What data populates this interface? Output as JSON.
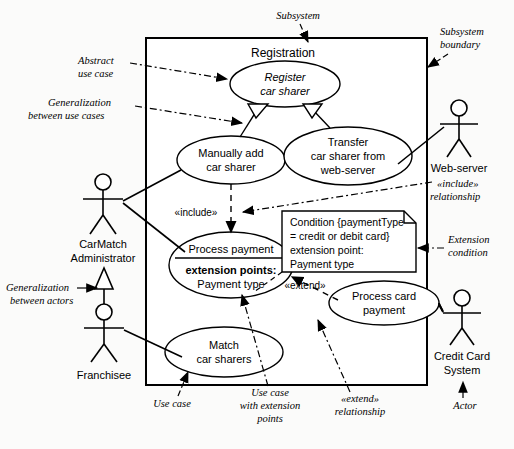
{
  "diagram": {
    "subsystem_label": "Registration",
    "stroke_color": "#000000",
    "background_color": "#fbfbfa"
  },
  "use_cases": [
    {
      "id": "register",
      "lines": [
        "Register",
        "car sharer"
      ],
      "style": "italic"
    },
    {
      "id": "manually_add",
      "lines": [
        "Manually add",
        "car sharer"
      ],
      "style": "normal"
    },
    {
      "id": "transfer",
      "lines": [
        "Transfer",
        "car sharer from",
        "web-server"
      ],
      "style": "normal"
    },
    {
      "id": "process_payment",
      "lines": [
        "Process payment"
      ],
      "compartment": {
        "heading": "extension points:",
        "value": "Payment type"
      },
      "style": "normal"
    },
    {
      "id": "match",
      "lines": [
        "Match",
        "car sharers"
      ],
      "style": "normal"
    },
    {
      "id": "process_card",
      "lines": [
        "Process card",
        "payment"
      ],
      "style": "normal"
    }
  ],
  "actors": [
    {
      "id": "carmatch_admin",
      "lines": [
        "CarMatch",
        "Administrator"
      ]
    },
    {
      "id": "franchisee",
      "lines": [
        "Franchisee"
      ]
    },
    {
      "id": "web_server",
      "lines": [
        "Web-server"
      ]
    },
    {
      "id": "credit_card",
      "lines": [
        "Credit Card",
        "System"
      ]
    }
  ],
  "note": {
    "lines": [
      "Condition {paymentType",
      " = credit or debit card}",
      "extension point:",
      "Payment type"
    ]
  },
  "stereotypes": [
    {
      "id": "include_label",
      "text": "«include»"
    },
    {
      "id": "extend_label",
      "text": "«extend»"
    }
  ],
  "annotations": [
    {
      "id": "abstract_use_case",
      "lines": [
        "Abstract",
        "use case"
      ]
    },
    {
      "id": "generalization_use_cases",
      "lines": [
        "Generalization",
        "between use cases"
      ]
    },
    {
      "id": "generalization_actors",
      "lines": [
        "Generalization",
        "between actors"
      ]
    },
    {
      "id": "subsystem",
      "lines": [
        "Subsystem"
      ]
    },
    {
      "id": "subsystem_boundary",
      "lines": [
        "Subsystem",
        "boundary"
      ]
    },
    {
      "id": "include_relationship",
      "lines": [
        "«include»",
        "relationship"
      ]
    },
    {
      "id": "extension_condition",
      "lines": [
        "Extension",
        "condition"
      ]
    },
    {
      "id": "use_case",
      "lines": [
        "Use case"
      ]
    },
    {
      "id": "use_case_with_ext_points",
      "lines": [
        "Use case",
        "with extension",
        "points"
      ]
    },
    {
      "id": "extend_relationship",
      "lines": [
        "«extend»",
        "relationship"
      ]
    },
    {
      "id": "actor",
      "lines": [
        "Actor"
      ]
    }
  ]
}
